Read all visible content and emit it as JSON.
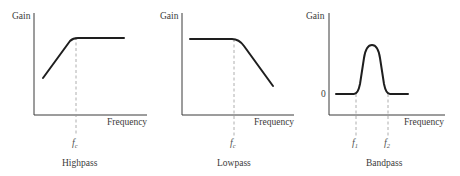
{
  "panels": [
    {
      "id": "highpass",
      "y_label": "Gain",
      "x_label": "Frequency",
      "cutoff_label_main": "f",
      "cutoff_label_sub": "c",
      "caption": "Highpass"
    },
    {
      "id": "lowpass",
      "y_label": "Gain",
      "x_label": "Frequency",
      "cutoff_label_main": "f",
      "cutoff_label_sub": "c",
      "caption": "Lowpass"
    },
    {
      "id": "bandpass",
      "y_label": "Gain",
      "x_label": "Frequency",
      "zero_label": "0",
      "f1_main": "f",
      "f1_sub": "1",
      "f2_main": "f",
      "f2_sub": "2",
      "caption": "Bandpass"
    }
  ],
  "colors": {
    "curve": "#1e1e1e",
    "axis": "#3a3a3a",
    "dashed_marker": "#9a9a9a",
    "background": "#ffffff"
  }
}
